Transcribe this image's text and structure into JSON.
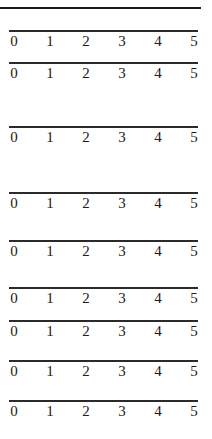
{
  "figure": {
    "top_rule": true,
    "number_lines": [
      {
        "y": 31,
        "labels": [
          "0",
          "1",
          "2",
          "3",
          "4",
          "5"
        ]
      },
      {
        "y": 63,
        "labels": [
          "0",
          "1",
          "2",
          "3",
          "4",
          "5"
        ]
      },
      {
        "y": 127,
        "labels": [
          "0",
          "1",
          "2",
          "3",
          "4",
          "5"
        ]
      },
      {
        "y": 193,
        "labels": [
          "0",
          "1",
          "2",
          "3",
          "4",
          "5"
        ]
      },
      {
        "y": 241,
        "labels": [
          "0",
          "1",
          "2",
          "3",
          "4",
          "5"
        ]
      },
      {
        "y": 288,
        "labels": [
          "0",
          "1",
          "2",
          "3",
          "4",
          "5"
        ]
      },
      {
        "y": 321,
        "labels": [
          "0",
          "1",
          "2",
          "3",
          "4",
          "5"
        ]
      },
      {
        "y": 361,
        "labels": [
          "0",
          "1",
          "2",
          "3",
          "4",
          "5"
        ]
      },
      {
        "y": 401,
        "labels": [
          "0",
          "1",
          "2",
          "3",
          "4",
          "5"
        ]
      }
    ],
    "tick_x": [
      14,
      50,
      86,
      122,
      158,
      194
    ],
    "colors": {
      "line": "#2a2a2a",
      "text": "#1a1a1a",
      "background": "#ffffff"
    }
  }
}
